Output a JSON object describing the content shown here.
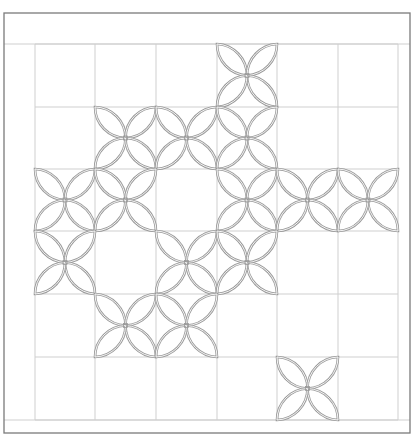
{
  "diagram": {
    "type": "quilt-pattern",
    "motif": "orange-peel",
    "colors": {
      "background": "#ffffff",
      "border": "#7a7a7a",
      "grid": "#cfcfcf",
      "petal": "#9a9a9a"
    },
    "frame": {
      "x1": 4,
      "y1": 13,
      "x2": 410,
      "y2": 433
    },
    "inner_band": {
      "top_y": 44,
      "bottom_y": 420
    },
    "columns_x": [
      35,
      95,
      156,
      217,
      277,
      338,
      398
    ],
    "rows_y": [
      44,
      107,
      169,
      231,
      294,
      357,
      420
    ],
    "motif_cells": [
      {
        "row": 0,
        "col": 3
      },
      {
        "row": 1,
        "col": 1
      },
      {
        "row": 1,
        "col": 2
      },
      {
        "row": 1,
        "col": 3
      },
      {
        "row": 2,
        "col": 0
      },
      {
        "row": 2,
        "col": 1
      },
      {
        "row": 2,
        "col": 3
      },
      {
        "row": 2,
        "col": 4
      },
      {
        "row": 2,
        "col": 5
      },
      {
        "row": 3,
        "col": 0
      },
      {
        "row": 3,
        "col": 2
      },
      {
        "row": 3,
        "col": 3
      },
      {
        "row": 4,
        "col": 1
      },
      {
        "row": 4,
        "col": 2
      },
      {
        "row": 5,
        "col": 4
      }
    ]
  }
}
